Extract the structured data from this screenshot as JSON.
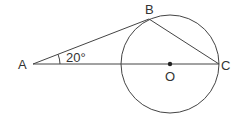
{
  "diagram": {
    "type": "geometry",
    "points": {
      "A": {
        "label": "A",
        "x": 33,
        "y": 64
      },
      "B": {
        "label": "B",
        "x": 149,
        "y": 19
      },
      "C": {
        "label": "C",
        "x": 219,
        "y": 64
      },
      "O": {
        "label": "O",
        "x": 170,
        "y": 64
      }
    },
    "circle": {
      "center": "O",
      "radius": 49
    },
    "segments": [
      [
        "A",
        "B"
      ],
      [
        "A",
        "C"
      ],
      [
        "B",
        "C"
      ]
    ],
    "angle": {
      "vertex": "A",
      "value_label": "20°"
    },
    "colors": {
      "stroke": "#444444",
      "text": "#333333",
      "background": "#ffffff"
    }
  }
}
